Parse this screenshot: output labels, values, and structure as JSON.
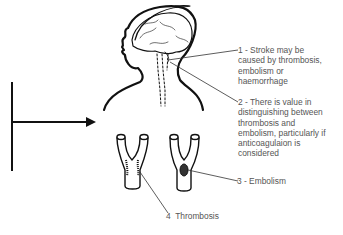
{
  "diagram": {
    "type": "medical-illustration",
    "colors": {
      "line": "#111111",
      "text": "#555555",
      "background": "#ffffff"
    },
    "labels": [
      {
        "id": "1",
        "text": "1 - Stroke may be\ncaused by thrombosis,\nembolism or\nhaemorrhage"
      },
      {
        "id": "2",
        "text": "2 - There is value in\ndistinguishing between\nthrombosis and\nembolism, particularly if\nanticoagulaion is\nconsidered"
      },
      {
        "id": "3",
        "text": "3 - Embolism"
      },
      {
        "id": "4",
        "text": "4  Thrombosis"
      }
    ],
    "figures": [
      {
        "name": "head-silhouette",
        "description": "Profile of head and shoulders with brain and dashed neck arteries"
      },
      {
        "name": "vessel-thrombosis",
        "description": "Y-shaped artery bifurcation with wall thrombus"
      },
      {
        "name": "vessel-embolism",
        "description": "Y-shaped artery bifurcation with lodged embolus"
      },
      {
        "name": "entry-arrow",
        "description": "Vertical bar with horizontal arrow pointing right"
      }
    ]
  }
}
